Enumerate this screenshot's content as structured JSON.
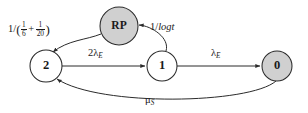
{
  "diagram": {
    "background_color": "#ffffff",
    "stroke_color": "#2b2b2b",
    "node_gray_fill": "#d0d0d0",
    "node_white_fill": "#ffffff",
    "nodes": [
      {
        "id": "rp",
        "label": "RP",
        "fill": "gray",
        "cx": 119,
        "cy": 26,
        "r": 19
      },
      {
        "id": "two",
        "label": "2",
        "fill": "white",
        "cx": 46,
        "cy": 66,
        "r": 16
      },
      {
        "id": "one",
        "label": "1",
        "fill": "white",
        "cx": 162,
        "cy": 66,
        "r": 15
      },
      {
        "id": "zero",
        "label": "0",
        "fill": "gray",
        "cx": 277,
        "cy": 66,
        "r": 15
      }
    ],
    "edges": [
      {
        "id": "rp-to-two",
        "from": "rp",
        "to": "two",
        "label_plain": "1/(1/6 + 1/20)",
        "label_parts": {
          "lead": "1/",
          "open": "(",
          "frac1_num": "1",
          "frac1_den": "6",
          "op": "+",
          "frac2_num": "1",
          "frac2_den": "20",
          "close": ")"
        }
      },
      {
        "id": "one-to-rp",
        "from": "one",
        "to": "rp",
        "label_plain": "1/logt",
        "label_parts": {
          "lead": "1/",
          "var": "logt"
        }
      },
      {
        "id": "two-to-one",
        "from": "two",
        "to": "one",
        "label_plain": "2λE",
        "label_parts": {
          "coef": "2λ",
          "sub": "E"
        }
      },
      {
        "id": "one-to-zero",
        "from": "one",
        "to": "zero",
        "label_plain": "λE",
        "label_parts": {
          "coef": "λ",
          "sub": "E"
        }
      },
      {
        "id": "zero-to-two",
        "from": "zero",
        "to": "two",
        "label_plain": "μS",
        "label_parts": {
          "coef": "μ",
          "sub": "S"
        }
      }
    ]
  }
}
